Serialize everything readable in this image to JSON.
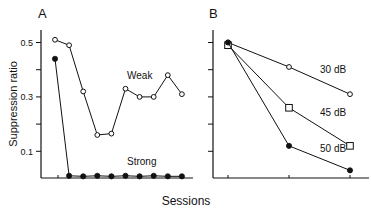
{
  "figure": {
    "xlabel": "Sessions",
    "ylabel": "Suppression ratio"
  },
  "chart_data": [
    {
      "panel": "A",
      "type": "line",
      "title": "A",
      "xlabel": "Sessions",
      "ylabel": "Suppression ratio",
      "ylim": [
        0,
        0.55
      ],
      "yticks": [
        0.1,
        0.2,
        0.3,
        0.4,
        0.5
      ],
      "ytick_labels": [
        "0.1",
        "",
        "0.3",
        "",
        "0.5"
      ],
      "grid": false,
      "x": [
        1,
        2,
        3,
        4,
        5,
        6,
        7,
        8,
        9,
        10
      ],
      "series": [
        {
          "name": "Weak",
          "marker": "open-circle",
          "values": [
            0.51,
            0.49,
            0.32,
            0.16,
            0.165,
            0.33,
            0.3,
            0.3,
            0.38,
            0.31
          ]
        },
        {
          "name": "Strong",
          "marker": "filled-circle",
          "values": [
            0.44,
            0.01,
            0.008,
            0.01,
            0.008,
            0.01,
            0.008,
            0.01,
            0.008,
            0.008
          ]
        }
      ],
      "annotations": [
        "Weak",
        "Strong"
      ]
    },
    {
      "panel": "B",
      "type": "line",
      "title": "B",
      "xlabel": "Sessions",
      "ylabel": "Suppression ratio",
      "ylim": [
        0,
        0.55
      ],
      "yticks": [
        0.1,
        0.2,
        0.3,
        0.4,
        0.5
      ],
      "grid": false,
      "x": [
        1,
        2,
        3
      ],
      "series": [
        {
          "name": "30 dB",
          "marker": "open-circle",
          "values": [
            0.5,
            0.41,
            0.31
          ]
        },
        {
          "name": "45 dB",
          "marker": "open-square",
          "values": [
            0.49,
            0.26,
            0.12
          ]
        },
        {
          "name": "50 dB",
          "marker": "filled-circle",
          "values": [
            0.5,
            0.12,
            0.03
          ]
        }
      ],
      "annotations": [
        "30 dB",
        "45 dB",
        "50 dB"
      ]
    }
  ]
}
